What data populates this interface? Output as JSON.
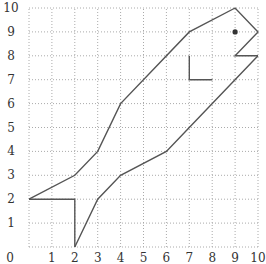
{
  "chart_data": {
    "type": "line",
    "title": "",
    "xlabel": "",
    "ylabel": "",
    "xlim": [
      0,
      10
    ],
    "ylim": [
      0,
      10
    ],
    "grid": true,
    "grid_style": "dotted",
    "legend": null,
    "x_ticks": [
      "0",
      "1",
      "2",
      "3",
      "4",
      "5",
      "6",
      "7",
      "8",
      "9",
      "10"
    ],
    "y_ticks": [
      "1",
      "2",
      "3",
      "4",
      "5",
      "6",
      "7",
      "8",
      "9",
      "10"
    ],
    "origin_label": "0",
    "series": [
      {
        "name": "upper-outline",
        "points": [
          [
            0,
            2
          ],
          [
            2,
            3
          ],
          [
            3,
            4
          ],
          [
            4,
            6
          ],
          [
            7,
            9
          ],
          [
            9,
            10
          ],
          [
            10,
            9
          ],
          [
            9,
            8
          ],
          [
            10,
            8
          ]
        ]
      },
      {
        "name": "lower-outline",
        "points": [
          [
            2,
            0
          ],
          [
            3,
            2
          ],
          [
            4,
            3
          ],
          [
            6,
            4
          ],
          [
            7,
            5
          ],
          [
            10,
            8
          ]
        ]
      },
      {
        "name": "tail",
        "points": [
          [
            0,
            2
          ],
          [
            2,
            2
          ],
          [
            2,
            0
          ]
        ]
      },
      {
        "name": "fin",
        "points": [
          [
            7,
            8
          ],
          [
            7,
            7
          ],
          [
            8,
            7
          ]
        ]
      }
    ],
    "markers": [
      {
        "name": "eye",
        "point": [
          9,
          9
        ]
      }
    ],
    "colors": {
      "line": "#555555",
      "grid": "#aaaaaa",
      "eye": "#333333"
    }
  }
}
